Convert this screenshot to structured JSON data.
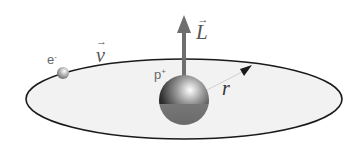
{
  "diagram": {
    "title": "",
    "labels": {
      "electron": "e",
      "electron_charge": "-",
      "velocity": "v",
      "proton": "p",
      "proton_charge": "+",
      "angular_momentum": "L",
      "radius": "r",
      "vector_arrow": "→"
    },
    "elements": [
      {
        "id": "orbit",
        "type": "ellipse",
        "desc": "electron orbit plane"
      },
      {
        "id": "proton",
        "type": "sphere",
        "desc": "nucleus (proton)"
      },
      {
        "id": "electron",
        "type": "sphere",
        "desc": "orbiting electron"
      },
      {
        "id": "L-arrow",
        "type": "arrow",
        "desc": "angular momentum vector pointing up"
      },
      {
        "id": "r-arrow",
        "type": "arrow",
        "desc": "radius from proton to orbit"
      }
    ],
    "colors": {
      "orbit_fill": "#f2f2f2",
      "orbit_stroke": "#1a1a1a",
      "L_arrow": "#6e6e6e",
      "label": "#666666"
    }
  }
}
